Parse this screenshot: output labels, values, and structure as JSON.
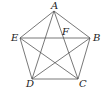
{
  "diagram": {
    "points": {
      "A": {
        "x": 54,
        "y": 11
      },
      "B": {
        "x": 90,
        "y": 38
      },
      "C": {
        "x": 78,
        "y": 79
      },
      "D": {
        "x": 32,
        "y": 79
      },
      "E": {
        "x": 20,
        "y": 38
      },
      "F": {
        "x": 63,
        "y": 38
      }
    },
    "labels": {
      "A": "A",
      "B": "B",
      "C": "C",
      "D": "D",
      "E": "E",
      "F": "F"
    },
    "edges": [
      [
        "A",
        "B"
      ],
      [
        "B",
        "C"
      ],
      [
        "C",
        "D"
      ],
      [
        "D",
        "E"
      ],
      [
        "E",
        "A"
      ],
      [
        "A",
        "C"
      ],
      [
        "A",
        "D"
      ],
      [
        "E",
        "B"
      ],
      [
        "E",
        "C"
      ],
      [
        "D",
        "B"
      ]
    ],
    "stroke_color": "#555555"
  }
}
